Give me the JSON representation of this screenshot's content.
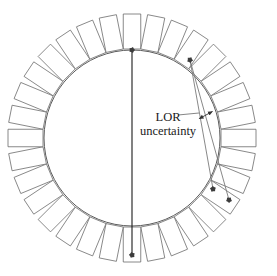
{
  "figure": {
    "kind": "pet-detector-ring-diagram",
    "width": 277,
    "height": 276,
    "background_color": "#ffffff"
  },
  "annotations": {
    "lor_label_line1": "LOR",
    "lor_label_line2": "uncertainty",
    "leader_line_color": "#555555",
    "arrow_color": "#333333"
  },
  "geometry": {
    "center_x": 132,
    "center_y": 138,
    "inner_ring_radius": 88,
    "detector_inner_radius": 89,
    "detector_outer_radius": 124,
    "detector_count": 32,
    "detector_width": 17.5,
    "ring_stroke_color": "#4a4a4a",
    "detector_stroke_color": "#6b6b6b",
    "detector_fill": "#ffffff",
    "detector_stroke_width": 0.8,
    "ring_stroke_width": 0.9
  },
  "chart_data": {
    "type": "diagram",
    "detector_ring": {
      "count": 32,
      "center": [
        132,
        138
      ],
      "inner_radius": 89,
      "outer_radius": 124,
      "block_width": 17.5
    },
    "detection_points": [
      {
        "name": "top-detection-point",
        "x": 132,
        "y": 50,
        "angle_deg": 90
      },
      {
        "name": "bottom-detection-point",
        "x": 132,
        "y": 255,
        "angle_deg": 270
      },
      {
        "name": "upper-right-detection-point",
        "x": 190,
        "y": 60,
        "angle_deg": 56.25
      },
      {
        "name": "lower-right-detection-point-a",
        "x": 213,
        "y": 189,
        "angle_deg": -33.75
      },
      {
        "name": "lower-right-detection-point-b",
        "x": 229,
        "y": 200,
        "angle_deg": -45
      }
    ],
    "lines_of_response": [
      {
        "name": "vertical-lor",
        "from": [
          132,
          50
        ],
        "to": [
          132,
          255
        ],
        "color": "#1a1a1a",
        "width": 1.1
      },
      {
        "name": "lor-fan-edge-1",
        "from": [
          190,
          60
        ],
        "to": [
          213,
          189
        ],
        "color": "#7a7a7a",
        "width": 0.9
      },
      {
        "name": "lor-fan-edge-2",
        "from": [
          190,
          60
        ],
        "to": [
          229,
          200
        ],
        "color": "#7a7a7a",
        "width": 0.9
      }
    ],
    "uncertainty_marker": {
      "label": "LOR uncertainty",
      "arrow_from": [
        200,
        118
      ],
      "arrow_to": [
        213,
        111
      ],
      "double_headed": true
    }
  }
}
